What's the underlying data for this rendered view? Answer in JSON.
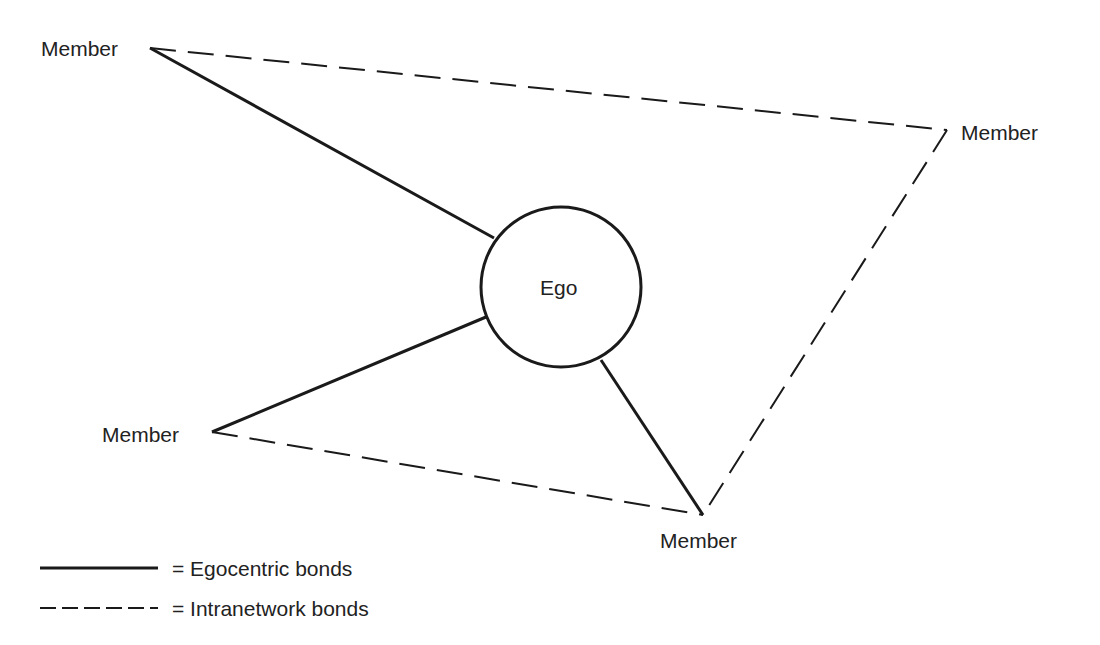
{
  "diagram": {
    "center": {
      "label": "Ego"
    },
    "members": [
      {
        "id": "top-left",
        "label": "Member"
      },
      {
        "id": "right",
        "label": "Member"
      },
      {
        "id": "left",
        "label": "Member"
      },
      {
        "id": "bottom",
        "label": "Member"
      }
    ],
    "egocentric_bonds": [
      "top-left",
      "left",
      "bottom"
    ],
    "intranetwork_bonds": [
      [
        "top-left",
        "right"
      ],
      [
        "right",
        "bottom"
      ],
      [
        "left",
        "bottom"
      ]
    ]
  },
  "legend": {
    "solid": "= Egocentric bonds",
    "dashed": "= Intranetwork bonds"
  },
  "colors": {
    "stroke": "#1a1a1a",
    "background": "#ffffff"
  }
}
